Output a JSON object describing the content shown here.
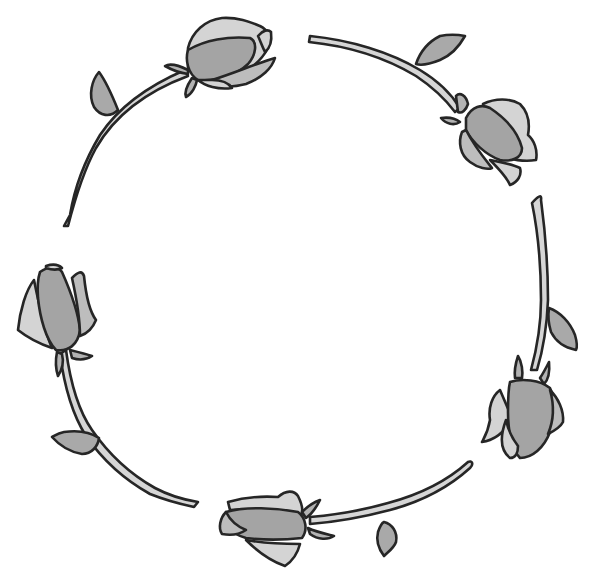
{
  "illustration": {
    "subject": "rose wreath",
    "rose_count": 6,
    "style": "grayscale line art",
    "colors": {
      "background": "#ffffff",
      "outline": "#262626",
      "stem": "#d6d6d6",
      "leaf": "#a9a9a9",
      "petal_light": "#d4d4d4",
      "petal_mid": "#bdbdbd",
      "petal_dark": "#a4a4a4"
    },
    "roses": [
      {
        "position": "top-left"
      },
      {
        "position": "top-right"
      },
      {
        "position": "right"
      },
      {
        "position": "bottom"
      },
      {
        "position": "left"
      },
      {
        "position": "bottom-left-stem"
      }
    ]
  }
}
